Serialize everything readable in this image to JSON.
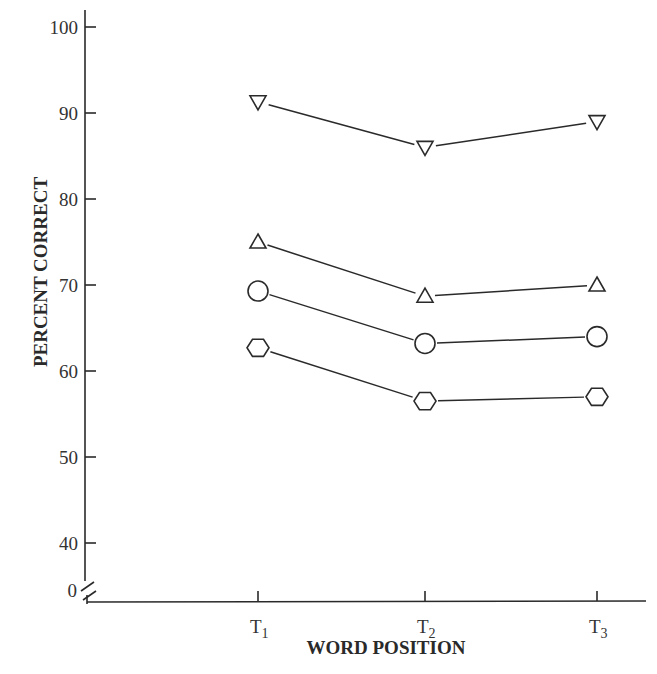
{
  "chart_data": {
    "type": "line",
    "title": "",
    "xlabel": "WORD POSITION",
    "ylabel": "PERCENT CORRECT",
    "categories": [
      "T1",
      "T2",
      "T3"
    ],
    "category_labels": [
      {
        "base": "T",
        "sub": "1"
      },
      {
        "base": "T",
        "sub": "2"
      },
      {
        "base": "T",
        "sub": "3"
      }
    ],
    "y_ticks": [
      0,
      40,
      50,
      60,
      70,
      80,
      90,
      100
    ],
    "y_axis_break": "between 0 and 40",
    "ylim": [
      35,
      100
    ],
    "grid": false,
    "legend": "none (series distinguished by marker shape)",
    "series": [
      {
        "name": "inverted-triangle",
        "marker": "inverted-triangle",
        "values": [
          91.3,
          86,
          89
        ]
      },
      {
        "name": "triangle",
        "marker": "triangle",
        "values": [
          75,
          68.7,
          70
        ]
      },
      {
        "name": "circle",
        "marker": "circle",
        "values": [
          69.3,
          63.2,
          64
        ]
      },
      {
        "name": "hexagon",
        "marker": "hexagon",
        "values": [
          62.7,
          56.5,
          57
        ]
      }
    ]
  },
  "colors": {
    "ink": "#2a2a2a",
    "background": "#ffffff"
  }
}
